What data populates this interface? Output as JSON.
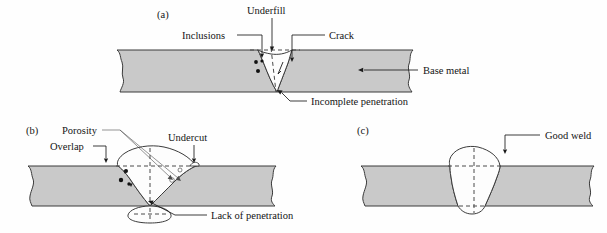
{
  "figure": {
    "background_color": "#fefefe",
    "base_metal_color": "#c9c9c9",
    "weld_color": "#fdfdfd",
    "line_color": "#3b3b3b"
  },
  "panels": [
    {
      "id": "a",
      "panel_label": "(a)",
      "description": "Defective weld cross-section with multiple discontinuities",
      "labels": [
        {
          "key": "underfill",
          "text": "Underfill",
          "name": "label-underfill"
        },
        {
          "key": "inclusions",
          "text": "Inclusions",
          "name": "label-inclusions"
        },
        {
          "key": "crack",
          "text": "Crack",
          "name": "label-crack"
        },
        {
          "key": "base_metal",
          "text": "Base metal",
          "name": "label-base-metal"
        },
        {
          "key": "incomplete_penetration",
          "text": "Incomplete penetration",
          "name": "label-incomplete-penetration"
        }
      ]
    },
    {
      "id": "b",
      "panel_label": "(b)",
      "description": "Defective weld cross-section with excess reinforcement and root defects",
      "labels": [
        {
          "key": "porosity",
          "text": "Porosity",
          "name": "label-porosity"
        },
        {
          "key": "overlap",
          "text": "Overlap",
          "name": "label-overlap"
        },
        {
          "key": "undercut",
          "text": "Undercut",
          "name": "label-undercut"
        },
        {
          "key": "lack_of_penetration",
          "text": "Lack of penetration",
          "name": "label-lack-of-penetration"
        }
      ]
    },
    {
      "id": "c",
      "panel_label": "(c)",
      "description": "Acceptable weld cross-section",
      "labels": [
        {
          "key": "good_weld",
          "text": "Good weld",
          "name": "label-good-weld"
        }
      ]
    }
  ]
}
